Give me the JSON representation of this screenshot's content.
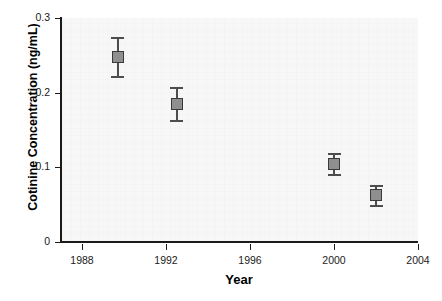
{
  "chart_data": {
    "type": "scatter",
    "title": "",
    "subtitle": "",
    "xlabel": "Year",
    "ylabel": "Cotinine Concentration (ng/mL)",
    "xlim": [
      1987,
      2004
    ],
    "ylim": [
      0,
      0.3
    ],
    "grid": false,
    "legend": "none",
    "xticks": [
      "1988",
      "1992",
      "1996",
      "2000",
      "2004"
    ],
    "xtick_values": [
      1988,
      1992,
      1996,
      2000,
      2004
    ],
    "yticks": [
      "0",
      "0.1",
      "0.2",
      "0.3"
    ],
    "ytick_values": [
      0,
      0.1,
      0.2,
      0.3
    ],
    "marker": "filled-square",
    "marker_color": "#8f8f8f",
    "marker_edge_color": "#3a3a3a",
    "errorbar_color": "#4d4d4d",
    "plot_background": "#f7f7f7",
    "axis_color": "#1a1a1a",
    "series": [
      {
        "name": "Cotinine concentration",
        "x": [
          1989.7,
          1992.5,
          2000.0,
          2002.0
        ],
        "values": [
          0.248,
          0.185,
          0.105,
          0.063
        ],
        "error_low": [
          0.026,
          0.022,
          0.014,
          0.013
        ],
        "error_high": [
          0.026,
          0.022,
          0.014,
          0.013
        ]
      }
    ],
    "points": [
      {
        "label": "1989-1990",
        "x": 1989.7,
        "y": 0.248,
        "y_low": 0.222,
        "y_high": 0.274
      },
      {
        "label": "1992-1993",
        "x": 1992.5,
        "y": 0.185,
        "y_low": 0.163,
        "y_high": 0.207
      },
      {
        "label": "1999-2000",
        "x": 2000.0,
        "y": 0.105,
        "y_low": 0.091,
        "y_high": 0.119
      },
      {
        "label": "2001-2002",
        "x": 2002.0,
        "y": 0.063,
        "y_low": 0.05,
        "y_high": 0.076
      }
    ]
  }
}
